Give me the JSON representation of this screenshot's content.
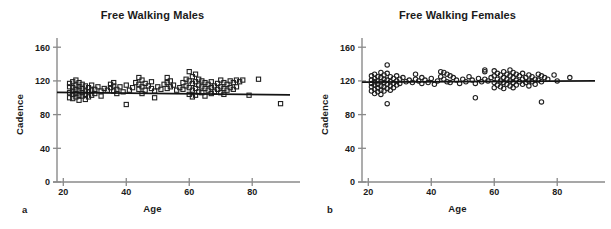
{
  "figure": {
    "panel_letters": [
      "a",
      "b"
    ]
  },
  "chart_data": [
    {
      "type": "scatter",
      "title": "Free Walking Males",
      "xlabel": "Age",
      "ylabel": "Cadence",
      "marker": "square",
      "xlim": [
        18,
        92
      ],
      "ylim": [
        0,
        165
      ],
      "xticks": [
        20,
        40,
        60,
        80
      ],
      "yticks": [
        0,
        40,
        80,
        120,
        160
      ],
      "grid": false,
      "legend": "none",
      "trendline": {
        "x": [
          18,
          92
        ],
        "y": [
          106.5,
          103.5
        ]
      },
      "points": [
        [
          22,
          117
        ],
        [
          22,
          113
        ],
        [
          22,
          106
        ],
        [
          22,
          100
        ],
        [
          23,
          119
        ],
        [
          23,
          112
        ],
        [
          23,
          108
        ],
        [
          23,
          104
        ],
        [
          23,
          99
        ],
        [
          24,
          121
        ],
        [
          24,
          115
        ],
        [
          24,
          110
        ],
        [
          24,
          105
        ],
        [
          24,
          101
        ],
        [
          25,
          118
        ],
        [
          25,
          113
        ],
        [
          25,
          109
        ],
        [
          25,
          103
        ],
        [
          25,
          97
        ],
        [
          26,
          116
        ],
        [
          26,
          111
        ],
        [
          26,
          106
        ],
        [
          26,
          102
        ],
        [
          27,
          114
        ],
        [
          27,
          108
        ],
        [
          27,
          104
        ],
        [
          27,
          98
        ],
        [
          28,
          112
        ],
        [
          28,
          107
        ],
        [
          28,
          101
        ],
        [
          29,
          115
        ],
        [
          29,
          109
        ],
        [
          29,
          103
        ],
        [
          30,
          110
        ],
        [
          30,
          105
        ],
        [
          31,
          113
        ],
        [
          32,
          108
        ],
        [
          32,
          102
        ],
        [
          33,
          111
        ],
        [
          34,
          109
        ],
        [
          35,
          116
        ],
        [
          35,
          112
        ],
        [
          36,
          118
        ],
        [
          36,
          114
        ],
        [
          36,
          108
        ],
        [
          37,
          110
        ],
        [
          37,
          105
        ],
        [
          38,
          113
        ],
        [
          39,
          107
        ],
        [
          40,
          115
        ],
        [
          40,
          92
        ],
        [
          41,
          109
        ],
        [
          42,
          112
        ],
        [
          43,
          118
        ],
        [
          44,
          124
        ],
        [
          44,
          116
        ],
        [
          44,
          110
        ],
        [
          45,
          121
        ],
        [
          45,
          113
        ],
        [
          45,
          105
        ],
        [
          46,
          117
        ],
        [
          46,
          109
        ],
        [
          47,
          114
        ],
        [
          48,
          119
        ],
        [
          48,
          111
        ],
        [
          49,
          108
        ],
        [
          49,
          100
        ],
        [
          50,
          113
        ],
        [
          51,
          110
        ],
        [
          52,
          116
        ],
        [
          53,
          124
        ],
        [
          53,
          118
        ],
        [
          53,
          111
        ],
        [
          54,
          120
        ],
        [
          54,
          113
        ],
        [
          55,
          115
        ],
        [
          56,
          109
        ],
        [
          57,
          112
        ],
        [
          58,
          118
        ],
        [
          58,
          110
        ],
        [
          59,
          122
        ],
        [
          59,
          114
        ],
        [
          60,
          131
        ],
        [
          60,
          120
        ],
        [
          60,
          112
        ],
        [
          60,
          104
        ],
        [
          61,
          125
        ],
        [
          61,
          117
        ],
        [
          61,
          109
        ],
        [
          61,
          101
        ],
        [
          62,
          128
        ],
        [
          62,
          119
        ],
        [
          62,
          111
        ],
        [
          62,
          103
        ],
        [
          63,
          122
        ],
        [
          63,
          115
        ],
        [
          63,
          107
        ],
        [
          64,
          120
        ],
        [
          64,
          113
        ],
        [
          64,
          106
        ],
        [
          65,
          118
        ],
        [
          65,
          111
        ],
        [
          65,
          102
        ],
        [
          66,
          116
        ],
        [
          66,
          109
        ],
        [
          67,
          119
        ],
        [
          67,
          112
        ],
        [
          67,
          105
        ],
        [
          68,
          114
        ],
        [
          68,
          107
        ],
        [
          69,
          117
        ],
        [
          69,
          110
        ],
        [
          70,
          121
        ],
        [
          70,
          113
        ],
        [
          70,
          106
        ],
        [
          71,
          118
        ],
        [
          71,
          111
        ],
        [
          71,
          104
        ],
        [
          72,
          116
        ],
        [
          72,
          109
        ],
        [
          73,
          120
        ],
        [
          73,
          112
        ],
        [
          74,
          118
        ],
        [
          74,
          110
        ],
        [
          75,
          121
        ],
        [
          75,
          113
        ],
        [
          76,
          119
        ],
        [
          77,
          121
        ],
        [
          79,
          103
        ],
        [
          82,
          122
        ],
        [
          89,
          93
        ]
      ]
    },
    {
      "type": "scatter",
      "title": "Free Walking Females",
      "xlabel": "Age",
      "ylabel": "Cadence",
      "marker": "circle",
      "xlim": [
        18,
        92
      ],
      "ylim": [
        0,
        165
      ],
      "xticks": [
        20,
        40,
        60,
        80
      ],
      "yticks": [
        0,
        40,
        80,
        120,
        160
      ],
      "grid": false,
      "legend": "none",
      "trendline": {
        "x": [
          18,
          92
        ],
        "y": [
          118.5,
          120.0
        ]
      },
      "points": [
        [
          21,
          126
        ],
        [
          21,
          121
        ],
        [
          21,
          117
        ],
        [
          21,
          113
        ],
        [
          21,
          108
        ],
        [
          22,
          128
        ],
        [
          22,
          123
        ],
        [
          22,
          119
        ],
        [
          22,
          115
        ],
        [
          22,
          110
        ],
        [
          22,
          105
        ],
        [
          23,
          125
        ],
        [
          23,
          120
        ],
        [
          23,
          116
        ],
        [
          23,
          112
        ],
        [
          23,
          107
        ],
        [
          24,
          130
        ],
        [
          24,
          124
        ],
        [
          24,
          119
        ],
        [
          24,
          114
        ],
        [
          24,
          109
        ],
        [
          24,
          104
        ],
        [
          25,
          127
        ],
        [
          25,
          122
        ],
        [
          25,
          118
        ],
        [
          25,
          113
        ],
        [
          25,
          108
        ],
        [
          26,
          139
        ],
        [
          26,
          129
        ],
        [
          26,
          121
        ],
        [
          26,
          116
        ],
        [
          26,
          111
        ],
        [
          26,
          93
        ],
        [
          27,
          125
        ],
        [
          27,
          119
        ],
        [
          27,
          114
        ],
        [
          27,
          109
        ],
        [
          28,
          123
        ],
        [
          28,
          117
        ],
        [
          28,
          112
        ],
        [
          29,
          126
        ],
        [
          29,
          120
        ],
        [
          29,
          115
        ],
        [
          30,
          122
        ],
        [
          30,
          117
        ],
        [
          31,
          124
        ],
        [
          32,
          119
        ],
        [
          33,
          121
        ],
        [
          34,
          118
        ],
        [
          35,
          128
        ],
        [
          35,
          122
        ],
        [
          36,
          120
        ],
        [
          37,
          124
        ],
        [
          37,
          117
        ],
        [
          38,
          121
        ],
        [
          39,
          118
        ],
        [
          40,
          123
        ],
        [
          41,
          116
        ],
        [
          42,
          120
        ],
        [
          43,
          131
        ],
        [
          43,
          125
        ],
        [
          44,
          130
        ],
        [
          44,
          122
        ],
        [
          45,
          128
        ],
        [
          45,
          119
        ],
        [
          46,
          126
        ],
        [
          46,
          118
        ],
        [
          47,
          124
        ],
        [
          48,
          121
        ],
        [
          49,
          117
        ],
        [
          50,
          122
        ],
        [
          51,
          119
        ],
        [
          52,
          125
        ],
        [
          53,
          121
        ],
        [
          54,
          117
        ],
        [
          54,
          100
        ],
        [
          55,
          123
        ],
        [
          56,
          119
        ],
        [
          57,
          133
        ],
        [
          57,
          131
        ],
        [
          57,
          122
        ],
        [
          58,
          120
        ],
        [
          59,
          124
        ],
        [
          60,
          132
        ],
        [
          60,
          126
        ],
        [
          60,
          118
        ],
        [
          60,
          112
        ],
        [
          61,
          129
        ],
        [
          61,
          122
        ],
        [
          61,
          115
        ],
        [
          62,
          127
        ],
        [
          62,
          120
        ],
        [
          62,
          113
        ],
        [
          63,
          131
        ],
        [
          63,
          124
        ],
        [
          63,
          118
        ],
        [
          63,
          111
        ],
        [
          64,
          128
        ],
        [
          64,
          122
        ],
        [
          64,
          116
        ],
        [
          65,
          133
        ],
        [
          65,
          126
        ],
        [
          65,
          120
        ],
        [
          65,
          114
        ],
        [
          66,
          130
        ],
        [
          66,
          124
        ],
        [
          66,
          118
        ],
        [
          66,
          112
        ],
        [
          67,
          128
        ],
        [
          67,
          121
        ],
        [
          67,
          115
        ],
        [
          68,
          126
        ],
        [
          68,
          119
        ],
        [
          69,
          129
        ],
        [
          69,
          122
        ],
        [
          69,
          116
        ],
        [
          70,
          124
        ],
        [
          70,
          118
        ],
        [
          71,
          127
        ],
        [
          71,
          120
        ],
        [
          71,
          114
        ],
        [
          72,
          125
        ],
        [
          72,
          119
        ],
        [
          73,
          122
        ],
        [
          73,
          116
        ],
        [
          74,
          128
        ],
        [
          74,
          121
        ],
        [
          75,
          126
        ],
        [
          75,
          119
        ],
        [
          75,
          95
        ],
        [
          76,
          124
        ],
        [
          77,
          122
        ],
        [
          79,
          127
        ],
        [
          80,
          120
        ],
        [
          84,
          124
        ]
      ]
    }
  ]
}
